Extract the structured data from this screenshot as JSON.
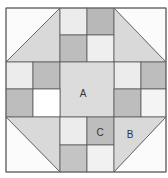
{
  "diagram": {
    "type": "quilt-block",
    "grid": {
      "cols": 6,
      "rows": 6
    },
    "colors": {
      "white": "#ffffff",
      "light": "#e8e8e8",
      "medium": "#d6d6d6",
      "dark": "#b4b4b4",
      "line": "#555555"
    },
    "labels": {
      "a": "A",
      "b": "B",
      "c": "C"
    }
  }
}
